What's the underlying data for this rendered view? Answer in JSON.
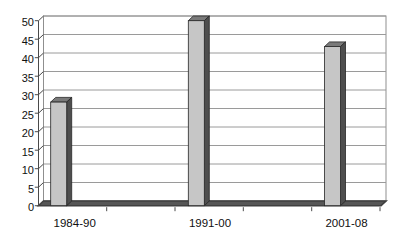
{
  "chart_data": {
    "type": "bar",
    "effect": "3d-column",
    "title": "",
    "xlabel": "",
    "ylabel": "",
    "categories": [
      "1984-90",
      "1991-00",
      "2001-08"
    ],
    "values": [
      28,
      50,
      43
    ],
    "series": [
      {
        "name": "",
        "values": [
          28,
          50,
          43
        ]
      }
    ],
    "ylim": [
      0,
      50
    ],
    "ytick_step": 5,
    "yticks": [
      0,
      5,
      10,
      15,
      20,
      25,
      30,
      35,
      40,
      45,
      50
    ],
    "grid": true,
    "legend": false,
    "colors": {
      "background": "#ffffff",
      "bar_front": "#c6c6c6",
      "bar_top": "#7a7a7a",
      "bar_side": "#4e4e4e",
      "bar_outline": "#262626",
      "floor": "#565656",
      "floor_edge": "#3f3f3f",
      "gridline": "#9a9a9a",
      "wall_edge": "#8f8f8f",
      "axis": "#4a4a4a",
      "text": "#101010"
    }
  }
}
